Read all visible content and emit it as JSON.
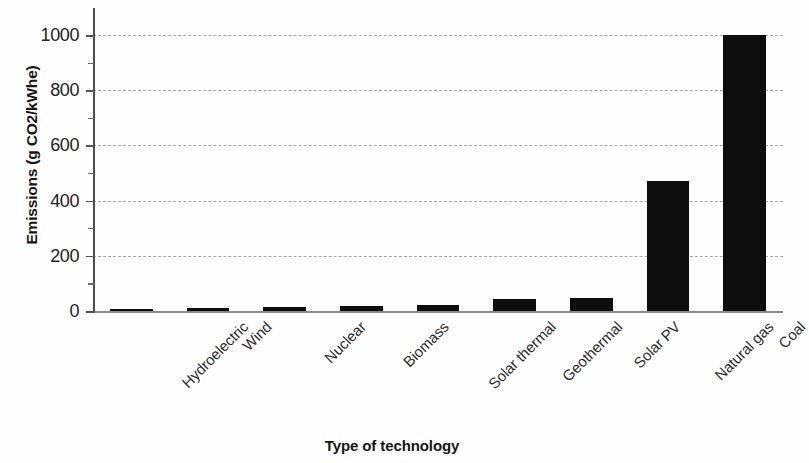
{
  "chart_data": {
    "type": "bar",
    "title": "",
    "subtitle": "",
    "xlabel": "Type of technology",
    "ylabel": "Emissions (g CO2/kWhe)",
    "categories": [
      "Hydroelectric",
      "Wind",
      "Nuclear",
      "Biomass",
      "Solar thermal",
      "Geothermal",
      "Solar PV",
      "Natural gas",
      "Coal"
    ],
    "values": [
      4,
      12,
      16,
      18,
      20,
      45,
      46,
      470,
      1000
    ],
    "ylim": [
      0,
      1100
    ],
    "yticks": [
      0,
      200,
      400,
      600,
      800,
      1000
    ],
    "ytick_labels": [
      "0",
      "200",
      "400",
      "600",
      "800",
      "1000"
    ],
    "minor_yticks": [
      100,
      300,
      500,
      700,
      900,
      1100
    ],
    "grid": "horizontal-dashed",
    "legend": "none",
    "bar_color": "#0d0d0d",
    "grid_color": "#a9a9a9",
    "axis_color": "#4d4d4d",
    "annotations": []
  }
}
